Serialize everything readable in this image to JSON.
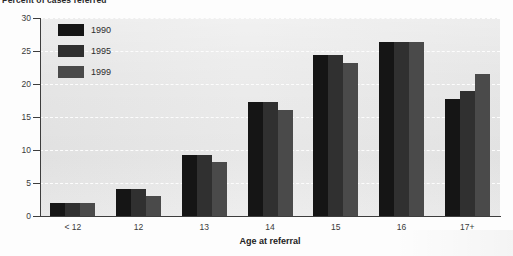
{
  "chart_data": {
    "type": "bar",
    "title": "Percent of cases referred",
    "xlabel": "Age at referral",
    "ylabel": "",
    "categories": [
      "< 12",
      "12",
      "13",
      "14",
      "15",
      "16",
      "17+"
    ],
    "series": [
      {
        "name": "1990",
        "color": "#151515",
        "values": [
          2.0,
          4.1,
          9.3,
          17.3,
          24.4,
          26.4,
          17.7
        ]
      },
      {
        "name": "1995",
        "color": "#303030",
        "values": [
          2.0,
          4.1,
          9.3,
          17.3,
          24.4,
          26.4,
          19.0
        ]
      },
      {
        "name": "1999",
        "color": "#4a4a4a",
        "values": [
          2.0,
          3.1,
          8.2,
          16.1,
          23.2,
          26.4,
          21.5
        ]
      }
    ],
    "ylim": [
      0,
      30
    ],
    "yticks": [
      0,
      5,
      10,
      15,
      20,
      25,
      30
    ],
    "ytick_labels": [
      "0",
      "5",
      "10",
      "15",
      "20",
      "25",
      "30"
    ],
    "grid": true,
    "grid_style": "dashed-white-horizontal",
    "legend_position": "upper-left-inside",
    "plot_background": "#e9e9e9"
  }
}
